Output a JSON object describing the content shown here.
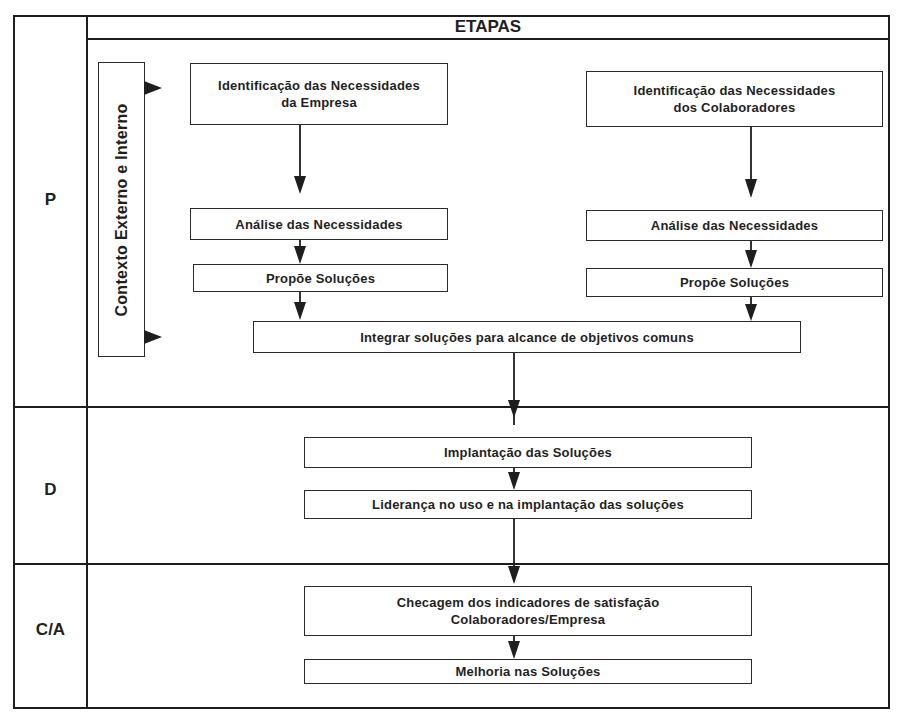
{
  "diagram": {
    "header": {
      "title": "ETAPAS"
    },
    "phases": [
      {
        "id": "P",
        "label": "P"
      },
      {
        "id": "D",
        "label": "D"
      },
      {
        "id": "CA",
        "label": "C/A"
      }
    ],
    "context": {
      "label": "Contexto Externo e Interno"
    },
    "nodes": {
      "id_empresa": {
        "line1": "Identificação das Necessidades",
        "line2": "da Empresa"
      },
      "id_colaboradores": {
        "line1": "Identificação das Necessidades",
        "line2": "dos Colaboradores"
      },
      "analise_empresa": {
        "label": "Análise das Necessidades"
      },
      "analise_colaboradores": {
        "label": "Análise das Necessidades"
      },
      "propoe_empresa": {
        "label": "Propõe Soluções"
      },
      "propoe_colaboradores": {
        "label": "Propõe Soluções"
      },
      "integrar": {
        "label": "Integrar soluções para alcance de objetivos comuns"
      },
      "implantacao": {
        "label": "Implantação das Soluções"
      },
      "lideranca": {
        "label": "Liderança no uso e na implantação das soluções"
      },
      "checagem": {
        "line1": "Checagem dos indicadores de satisfação",
        "line2": "Colaboradores/Empresa"
      },
      "melhoria": {
        "label": "Melhoria nas Soluções"
      }
    },
    "edges": [
      {
        "from": "context",
        "to": "id_empresa"
      },
      {
        "from": "context",
        "to": "integrar"
      },
      {
        "from": "id_empresa",
        "to": "analise_empresa"
      },
      {
        "from": "analise_empresa",
        "to": "propoe_empresa"
      },
      {
        "from": "propoe_empresa",
        "to": "integrar"
      },
      {
        "from": "id_colaboradores",
        "to": "analise_colaboradores"
      },
      {
        "from": "analise_colaboradores",
        "to": "propoe_colaboradores"
      },
      {
        "from": "propoe_colaboradores",
        "to": "integrar"
      },
      {
        "from": "integrar",
        "to": "implantacao"
      },
      {
        "from": "implantacao",
        "to": "lideranca"
      },
      {
        "from": "lideranca",
        "to": "checagem"
      },
      {
        "from": "checagem",
        "to": "melhoria"
      }
    ],
    "colors": {
      "line": "#1e1e1e",
      "background": "#ffffff",
      "text": "#1f1f1f"
    }
  }
}
